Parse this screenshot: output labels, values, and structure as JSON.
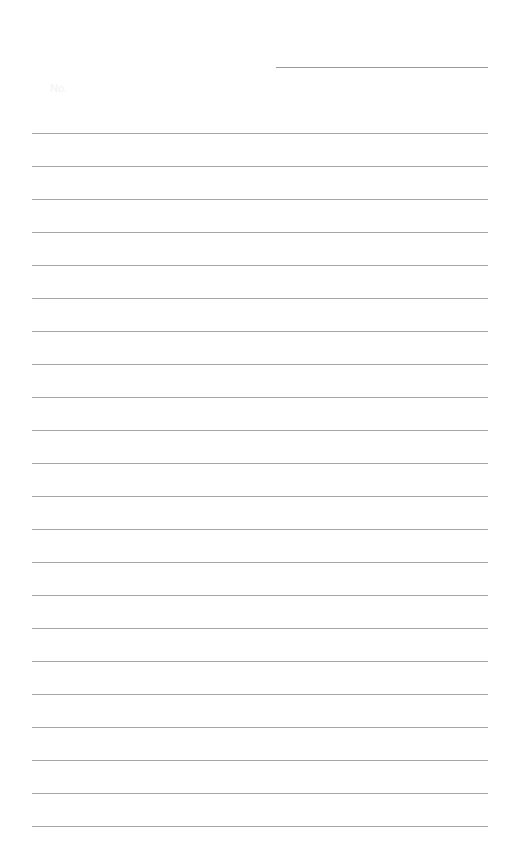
{
  "page": {
    "type": "lined-notepaper",
    "header": {
      "number_label": "No.",
      "date_line_text": ""
    },
    "rule_count": 22,
    "rule_color": "#a6a6a6",
    "lines": [
      "",
      "",
      "",
      "",
      "",
      "",
      "",
      "",
      "",
      "",
      "",
      "",
      "",
      "",
      "",
      "",
      "",
      "",
      "",
      "",
      "",
      ""
    ]
  }
}
